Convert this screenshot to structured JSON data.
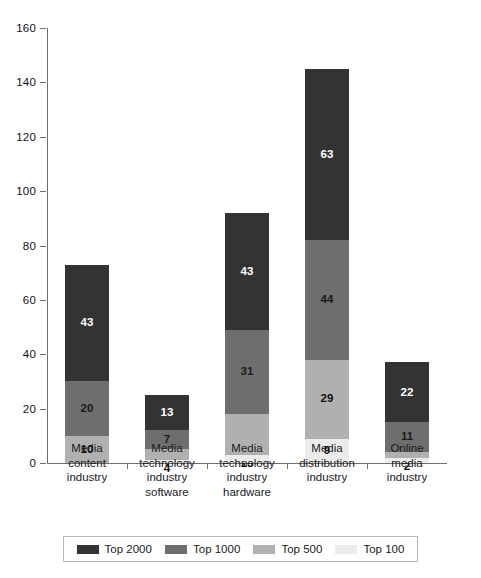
{
  "chart_data": {
    "type": "bar",
    "stacked": true,
    "title": "",
    "subtitle": "",
    "xlabel": "",
    "ylabel": "",
    "ylim": [
      0,
      160
    ],
    "ytick_step": 20,
    "yticks": [
      0,
      20,
      40,
      60,
      80,
      100,
      120,
      140,
      160
    ],
    "grid": false,
    "legend_position": "bottom",
    "categories": [
      "Media content industry",
      "Media technology industry software",
      "Media technology industry hardware",
      "Media distribution industry",
      "Online media industry"
    ],
    "category_lines": [
      [
        "Media",
        "content",
        "industry"
      ],
      [
        "Media",
        "technology",
        "industry",
        "software"
      ],
      [
        "Media",
        "technology",
        "industry",
        "hardware"
      ],
      [
        "Media",
        "distribution",
        "industry"
      ],
      [
        "Online",
        "media",
        "industry"
      ]
    ],
    "series": [
      {
        "name": "Top 2000",
        "color": "#333334",
        "values": [
          43,
          13,
          43,
          63,
          22
        ]
      },
      {
        "name": "Top 1000",
        "color": "#6e6e70",
        "values": [
          20,
          7,
          31,
          44,
          11
        ]
      },
      {
        "name": "Top 500",
        "color": "#b0b0b1",
        "values": [
          10,
          4,
          15,
          29,
          2
        ]
      },
      {
        "name": "Top 100",
        "color": "#ebebec",
        "values": [
          0,
          1,
          3,
          9,
          2
        ]
      }
    ],
    "stack_order_bottom_to_top": [
      "Top 100",
      "Top 500",
      "Top 1000",
      "Top 2000"
    ],
    "totals": [
      73,
      25,
      92,
      145,
      37
    ],
    "label_overrides": {
      "note": "Smallest bottom segments render their value below the x-axis",
      "below_axis": [
        {
          "category_index": 1,
          "series": "Top 500",
          "value": 1
        },
        {
          "category_index": 2,
          "series": "Top 500",
          "value": 3
        },
        {
          "category_index": 4,
          "series": "Top 500",
          "value": 2
        }
      ]
    }
  },
  "legend": {
    "items": [
      {
        "label": "Top 2000"
      },
      {
        "label": "Top 1000"
      },
      {
        "label": "Top 500"
      },
      {
        "label": "Top 100"
      }
    ]
  },
  "caption": {
    "text": ""
  }
}
